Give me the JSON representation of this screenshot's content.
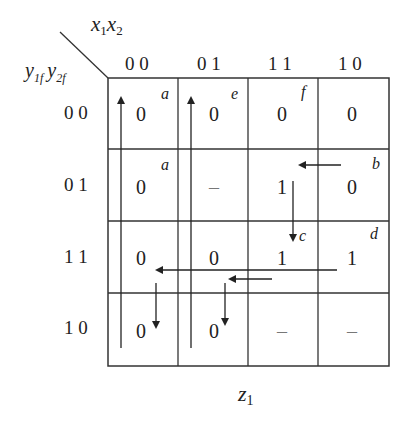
{
  "axis": {
    "col_var": "x1x2",
    "col_var_parts": [
      "x",
      "1",
      "x",
      "2"
    ],
    "row_var_parts": [
      "y",
      "1f",
      "y",
      "2f"
    ],
    "col_labels": [
      "0 0",
      "0 1",
      "1 1",
      "1 0"
    ],
    "row_labels": [
      "0 0",
      "0 1",
      "1 1",
      "1 0"
    ]
  },
  "cells": [
    [
      "0",
      "0",
      "0",
      "0"
    ],
    [
      "0",
      "–",
      "1",
      "0"
    ],
    [
      "0",
      "0",
      "1",
      "1"
    ],
    [
      "0",
      "0",
      "–",
      "–"
    ]
  ],
  "state_labels": [
    {
      "row": 0,
      "col": 0,
      "label": "a"
    },
    {
      "row": 0,
      "col": 1,
      "label": "e"
    },
    {
      "row": 0,
      "col": 2,
      "label": "f"
    },
    {
      "row": 1,
      "col": 0,
      "label": "a"
    },
    {
      "row": 1,
      "col": 3,
      "label": "b"
    },
    {
      "row": 2,
      "col": 2,
      "label": "c"
    },
    {
      "row": 2,
      "col": 3,
      "label": "d"
    }
  ],
  "footer": {
    "var": "z",
    "sub": "1"
  },
  "colors": {
    "line": "#333333",
    "text": "#222222"
  }
}
